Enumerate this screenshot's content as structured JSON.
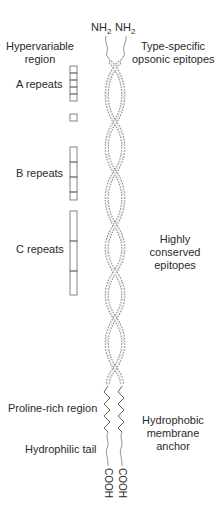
{
  "diagram": {
    "termini": {
      "n_left": {
        "base": "NH",
        "sub": "2"
      },
      "n_right": {
        "base": "NH",
        "sub": "2"
      },
      "c_left": "COOH",
      "c_right": "COOH"
    },
    "left_labels": {
      "hypervariable_line1": "Hypervariable",
      "hypervariable_line2": "region",
      "a_repeats": "A  repeats",
      "b_repeats": "B  repeats",
      "c_repeats": "C  repeats",
      "proline_rich": "Proline-rich region",
      "hydrophilic_tail": "Hydrophilic tail"
    },
    "right_labels": {
      "type_specific_line1": "Type-specific",
      "type_specific_line2": "opsonic epitopes",
      "conserved_line1": "Highly",
      "conserved_line2": "conserved",
      "conserved_line3": "epitopes",
      "anchor_line1": "Hydrophobic",
      "anchor_line2": "membrane",
      "anchor_line3": "anchor"
    },
    "repeat_blocks": {
      "A": {
        "count": 5,
        "extra_single": 1
      },
      "B": {
        "count": 4
      },
      "C": {
        "count": 3
      }
    },
    "colors": {
      "stroke": "#555555",
      "text": "#2a2a2a",
      "background": "#ffffff"
    }
  }
}
